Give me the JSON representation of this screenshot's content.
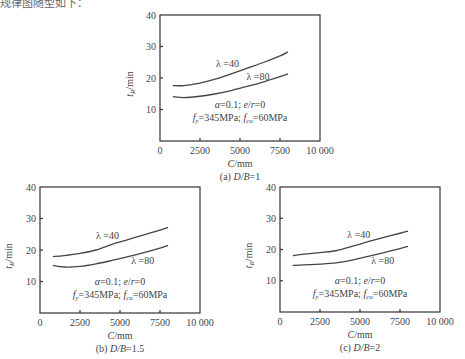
{
  "header_fragment": "规律图随型如下：",
  "chart_data": [
    {
      "type": "line",
      "panel": "a",
      "caption": "(a) D/B=1",
      "xlabel": "C/mm",
      "ylabel": "tR/min",
      "xlim": [
        0,
        10000
      ],
      "ylim": [
        0,
        40
      ],
      "xticks": [
        0,
        2500,
        5000,
        7500,
        10000
      ],
      "xtick_labels": [
        "0",
        "2500",
        "5000",
        "7500",
        "10 000"
      ],
      "yticks": [
        10,
        20,
        30,
        40
      ],
      "ytick_labels": [
        "10",
        "20",
        "30",
        "40"
      ],
      "annotations": [
        "α=0.1; e/r=0",
        "fy=345MPa; fcu=60MPa"
      ],
      "grid": false,
      "series": [
        {
          "name": "λ=40",
          "x": [
            800,
            1500,
            2500,
            3500,
            4500,
            5500,
            6500,
            7500,
            8000
          ],
          "y": [
            17.6,
            17.6,
            18.4,
            19.7,
            21.4,
            23.2,
            25.0,
            27.0,
            28.3
          ]
        },
        {
          "name": "λ=80",
          "x": [
            800,
            1500,
            2500,
            3500,
            4500,
            5500,
            6500,
            7500,
            8000
          ],
          "y": [
            14.1,
            13.8,
            14.2,
            15.0,
            16.1,
            17.4,
            18.8,
            20.4,
            21.3
          ]
        }
      ]
    },
    {
      "type": "line",
      "panel": "b",
      "caption": "(b) D/B=1.5",
      "xlabel": "C/mm",
      "ylabel": "tR/min",
      "xlim": [
        0,
        10000
      ],
      "ylim": [
        0,
        40
      ],
      "xticks": [
        0,
        2500,
        5000,
        7500,
        10000
      ],
      "xtick_labels": [
        "0",
        "2500",
        "5000",
        "7500",
        "10 000"
      ],
      "yticks": [
        10,
        20,
        30,
        40
      ],
      "ytick_labels": [
        "10",
        "20",
        "30",
        "40"
      ],
      "annotations": [
        "α=0.1; e/r=0",
        "fy=345MPa; fcu=60MPa"
      ],
      "grid": false,
      "series": [
        {
          "name": "λ=40",
          "x": [
            800,
            1500,
            2500,
            3500,
            4500,
            5500,
            6500,
            7500,
            8000
          ],
          "y": [
            17.9,
            18.2,
            18.9,
            20.0,
            21.8,
            23.3,
            24.8,
            26.3,
            27.2
          ]
        },
        {
          "name": "λ=80",
          "x": [
            800,
            1500,
            2500,
            3500,
            4500,
            5500,
            6500,
            7500,
            8000
          ],
          "y": [
            15.1,
            14.6,
            14.8,
            15.6,
            16.7,
            17.9,
            19.2,
            20.6,
            21.5
          ]
        }
      ]
    },
    {
      "type": "line",
      "panel": "c",
      "caption": "(c) D/B=2",
      "xlabel": "C/mm",
      "ylabel": "tR/min",
      "xlim": [
        0,
        10000
      ],
      "ylim": [
        0,
        40
      ],
      "xticks": [
        0,
        2500,
        5000,
        7500,
        10000
      ],
      "xtick_labels": [
        "0",
        "2500",
        "5000",
        "7500",
        "10 000"
      ],
      "yticks": [
        10,
        20,
        30,
        40
      ],
      "ytick_labels": [
        "10",
        "20",
        "30",
        "40"
      ],
      "annotations": [
        "α=0.1; e/r=0",
        "fy=345MPa; fcu=60MPa"
      ],
      "grid": false,
      "series": [
        {
          "name": "λ=40",
          "x": [
            800,
            1500,
            2500,
            3500,
            4500,
            5500,
            6500,
            7500,
            8000
          ],
          "y": [
            18.0,
            18.5,
            19.0,
            19.6,
            21.0,
            22.5,
            23.9,
            25.2,
            25.9
          ]
        },
        {
          "name": "λ=80",
          "x": [
            800,
            1500,
            2500,
            3500,
            4500,
            5500,
            6500,
            7500,
            8000
          ],
          "y": [
            14.9,
            15.1,
            15.3,
            15.7,
            16.6,
            17.8,
            19.0,
            20.3,
            21.0
          ]
        }
      ]
    }
  ],
  "panels": [
    {
      "left": 160,
      "top": 15,
      "width": 160,
      "height": 126,
      "ylabel_x": 133,
      "lam40_pos": [
        3500,
        23.5
      ],
      "lam80_pos": [
        5400,
        19.5
      ],
      "anno_pos": [
        5000,
        10.5
      ]
    },
    {
      "left": 40,
      "top": 187,
      "width": 160,
      "height": 126,
      "ylabel_x": 12,
      "lam40_pos": [
        3500,
        23.5
      ],
      "lam80_pos": [
        5700,
        15.5
      ],
      "anno_pos": [
        5000,
        9.0
      ]
    },
    {
      "left": 280,
      "top": 187,
      "width": 160,
      "height": 125,
      "ylabel_x": 252,
      "lam40_pos": [
        4200,
        23.8
      ],
      "lam80_pos": [
        5700,
        15.5
      ],
      "anno_pos": [
        5000,
        9.0
      ]
    }
  ]
}
